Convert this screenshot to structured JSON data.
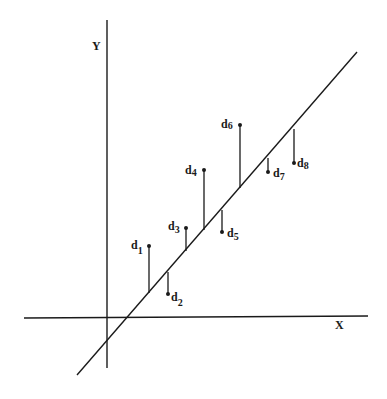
{
  "diagram": {
    "title": "",
    "axes": {
      "x_label": "X",
      "y_label": "Y"
    },
    "regression_line": {
      "from": [
        77,
        375
      ],
      "to": [
        357,
        52
      ]
    },
    "colors": {
      "ink": "#1a1a1a",
      "background": "#ffffff"
    },
    "points": [
      {
        "name": "d",
        "sub": "1",
        "x": 149,
        "point_y": 246,
        "line_y": 293,
        "side": "above"
      },
      {
        "name": "d",
        "sub": "2",
        "x": 168,
        "point_y": 294,
        "line_y": 272,
        "side": "below"
      },
      {
        "name": "d",
        "sub": "3",
        "x": 186,
        "point_y": 228,
        "line_y": 251,
        "side": "above"
      },
      {
        "name": "d",
        "sub": "4",
        "x": 204,
        "point_y": 170,
        "line_y": 230,
        "side": "above"
      },
      {
        "name": "d",
        "sub": "5",
        "x": 222,
        "point_y": 232,
        "line_y": 210,
        "side": "below"
      },
      {
        "name": "d",
        "sub": "6",
        "x": 240,
        "point_y": 125,
        "line_y": 188,
        "side": "above"
      },
      {
        "name": "d",
        "sub": "7",
        "x": 268,
        "point_y": 172,
        "line_y": 158,
        "side": "below"
      },
      {
        "name": "d",
        "sub": "8",
        "x": 294,
        "point_y": 163,
        "line_y": 129,
        "side": "below"
      }
    ]
  }
}
